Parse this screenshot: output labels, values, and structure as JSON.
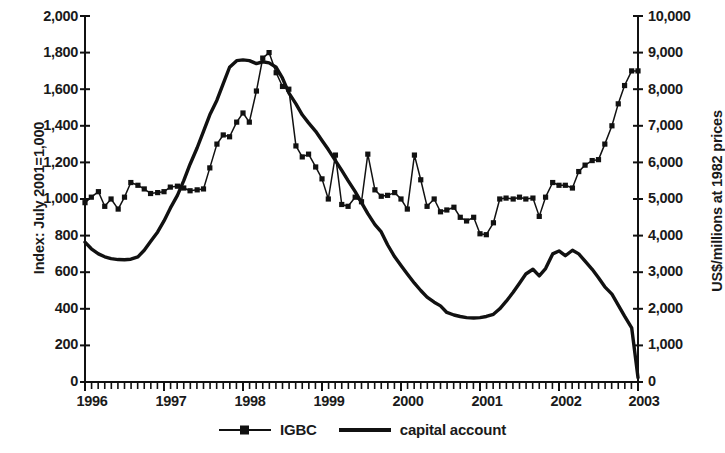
{
  "chart_data": {
    "type": "line",
    "title": "",
    "subtitle": "",
    "xlabel": "",
    "ylabel": "Index: July 2001=1,000",
    "y2label": "US$/millions at 1982 prices",
    "grid": false,
    "legend_position": "bottom",
    "xlim": [
      1996.0,
      2003.0
    ],
    "ylim": [
      0,
      2000
    ],
    "y2lim": [
      0,
      10000
    ],
    "x_tick_labels": [
      "1996",
      "1997",
      "1998",
      "1999",
      "2000",
      "2001",
      "2002",
      "2003"
    ],
    "x_tick_values": [
      1996,
      1997,
      1998,
      1999,
      2000,
      2001,
      2002,
      2003
    ],
    "x_minor_ticks": "monthly",
    "y_tick_labels": [
      "0",
      "200",
      "400",
      "600",
      "800",
      "1,000",
      "1,200",
      "1,400",
      "1,600",
      "1,800",
      "2,000"
    ],
    "y_tick_values": [
      0,
      200,
      400,
      600,
      800,
      1000,
      1200,
      1400,
      1600,
      1800,
      2000
    ],
    "y2_tick_labels": [
      "0",
      "1,000",
      "2,000",
      "3,000",
      "4,000",
      "5,000",
      "6,000",
      "7,000",
      "8,000",
      "9,000",
      "10,000"
    ],
    "y2_tick_values": [
      0,
      1000,
      2000,
      3000,
      4000,
      5000,
      6000,
      7000,
      8000,
      9000,
      10000
    ],
    "series": [
      {
        "name": "IGBC",
        "axis": "left",
        "style": "line-with-square-markers",
        "color": "#000000",
        "x": [
          1996.0,
          1996.08,
          1996.17,
          1996.25,
          1996.33,
          1996.42,
          1996.5,
          1996.58,
          1996.67,
          1996.75,
          1996.83,
          1996.92,
          1997.0,
          1997.08,
          1997.17,
          1997.25,
          1997.33,
          1997.42,
          1997.5,
          1997.58,
          1997.67,
          1997.75,
          1997.83,
          1997.92,
          1998.0,
          1998.08,
          1998.17,
          1998.25,
          1998.33,
          1998.42,
          1998.5,
          1998.58,
          1998.67,
          1998.75,
          1998.83,
          1998.92,
          1999.0,
          1999.08,
          1999.17,
          1999.25,
          1999.33,
          1999.42,
          1999.5,
          1999.58,
          1999.67,
          1999.75,
          1999.83,
          1999.92,
          2000.0,
          2000.08,
          2000.17,
          2000.25,
          2000.33,
          2000.42,
          2000.5,
          2000.58,
          2000.67,
          2000.75,
          2000.83,
          2000.92,
          2001.0,
          2001.08,
          2001.17,
          2001.25,
          2001.33,
          2001.42,
          2001.5,
          2001.58,
          2001.67,
          2001.75,
          2001.83,
          2001.92,
          2002.0,
          2002.08,
          2002.17,
          2002.25,
          2002.33,
          2002.42,
          2002.5,
          2002.58,
          2002.67,
          2002.75,
          2002.83,
          2002.92,
          2003.0
        ],
        "values": [
          980,
          1010,
          1040,
          960,
          1000,
          945,
          1010,
          1090,
          1075,
          1055,
          1030,
          1035,
          1040,
          1065,
          1070,
          1060,
          1045,
          1050,
          1055,
          1170,
          1300,
          1350,
          1340,
          1420,
          1470,
          1420,
          1590,
          1770,
          1800,
          1690,
          1615,
          1600,
          1290,
          1230,
          1245,
          1175,
          1110,
          1000,
          1240,
          970,
          960,
          1010,
          985,
          1245,
          1050,
          1015,
          1020,
          1035,
          1000,
          945,
          1240,
          1105,
          960,
          1000,
          930,
          940,
          955,
          900,
          880,
          900,
          810,
          805,
          870,
          1000,
          1005,
          1000,
          1010,
          1000,
          1005,
          905,
          1010,
          1090,
          1075,
          1075,
          1060,
          1150,
          1185,
          1210,
          1215,
          1300,
          1400,
          1520,
          1620,
          1700,
          1700
        ]
      },
      {
        "name": "capital account",
        "axis": "right",
        "style": "thick-line",
        "color": "#000000",
        "x": [
          1996.0,
          1996.08,
          1996.17,
          1996.25,
          1996.33,
          1996.42,
          1996.5,
          1996.58,
          1996.67,
          1996.75,
          1996.83,
          1996.92,
          1997.0,
          1997.08,
          1997.17,
          1997.25,
          1997.33,
          1997.42,
          1997.5,
          1997.58,
          1997.67,
          1997.75,
          1997.83,
          1997.92,
          1998.0,
          1998.08,
          1998.17,
          1998.25,
          1998.33,
          1998.42,
          1998.5,
          1998.58,
          1998.67,
          1998.75,
          1998.83,
          1998.92,
          1999.0,
          1999.08,
          1999.17,
          1999.25,
          1999.33,
          1999.42,
          1999.5,
          1999.58,
          1999.67,
          1999.75,
          1999.83,
          1999.92,
          2000.0,
          2000.08,
          2000.17,
          2000.25,
          2000.33,
          2000.42,
          2000.5,
          2000.58,
          2000.67,
          2000.75,
          2000.83,
          2000.92,
          2001.0,
          2001.08,
          2001.17,
          2001.25,
          2001.33,
          2001.42,
          2001.5,
          2001.58,
          2001.67,
          2001.75,
          2001.83,
          2001.92,
          2002.0,
          2002.08,
          2002.17,
          2002.25,
          2002.33,
          2002.42,
          2002.5,
          2002.58,
          2002.67,
          2002.75,
          2002.83,
          2002.92,
          2003.0
        ],
        "values": [
          3820,
          3640,
          3500,
          3420,
          3370,
          3345,
          3340,
          3355,
          3420,
          3600,
          3840,
          4100,
          4400,
          4750,
          5100,
          5500,
          5950,
          6400,
          6850,
          7300,
          7700,
          8150,
          8600,
          8780,
          8800,
          8780,
          8700,
          8750,
          8720,
          8600,
          8300,
          7900,
          7600,
          7300,
          7080,
          6850,
          6600,
          6350,
          6050,
          5780,
          5500,
          5200,
          4900,
          4600,
          4300,
          4100,
          3750,
          3420,
          3180,
          2950,
          2700,
          2500,
          2320,
          2180,
          2080,
          1900,
          1830,
          1790,
          1760,
          1750,
          1760,
          1790,
          1850,
          2000,
          2200,
          2450,
          2700,
          2950,
          3080,
          2900,
          3100,
          3500,
          3580,
          3450,
          3600,
          3500,
          3300,
          3080,
          2850,
          2600,
          2400,
          2100,
          1800,
          1480,
          120
        ]
      }
    ]
  },
  "axes": {
    "left_title": "Index: July 2001=1,000",
    "right_title": "US$/millions at 1982 prices",
    "y_left_ticks": [
      "2,000",
      "1,800",
      "1,600",
      "1,400",
      "1,200",
      "1,000",
      "800",
      "600",
      "400",
      "200",
      "0"
    ],
    "y_right_ticks": [
      "10,000",
      "9,000",
      "8,000",
      "7,000",
      "6,000",
      "5,000",
      "4,000",
      "3,000",
      "2,000",
      "1,000",
      "0"
    ],
    "x_ticks": [
      "1996",
      "1997",
      "1998",
      "1999",
      "2000",
      "2001",
      "2002",
      "2003"
    ]
  },
  "legend": {
    "items": [
      {
        "label": "IGBC",
        "marker": "square-line"
      },
      {
        "label": "capital account",
        "marker": "thick-line"
      }
    ]
  }
}
